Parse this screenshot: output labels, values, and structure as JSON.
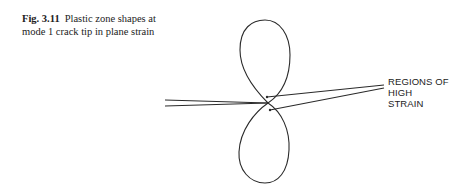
{
  "caption": {
    "figure_number": "Fig. 3.11",
    "text": "Plastic zone shapes at mode 1 crack tip in plane strain"
  },
  "figure": {
    "annotation_line1": "REGIONS OF HIGH",
    "annotation_line2": "STRAIN",
    "line_color": "#2a2a2a"
  }
}
